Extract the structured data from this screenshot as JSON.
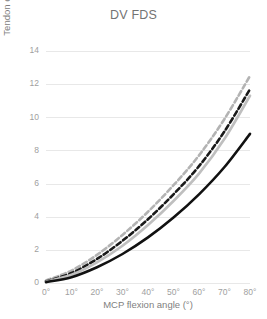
{
  "chart_data": {
    "type": "line",
    "title": "DV FDS",
    "xlabel": "MCP flexion angle (°)",
    "ylabel": "Tendon excursion (mm)",
    "x": [
      0,
      10,
      20,
      30,
      40,
      50,
      60,
      70,
      80
    ],
    "xticklabels": [
      "0°",
      "10°",
      "20°",
      "30°",
      "40°",
      "50°",
      "60°",
      "70°",
      "80°"
    ],
    "yticks": [
      0,
      2,
      4,
      6,
      8,
      10,
      12,
      14
    ],
    "yticklabels": [
      "0",
      "2",
      "4",
      "6",
      "8",
      "10",
      "12",
      "14"
    ],
    "xlim": [
      0,
      80
    ],
    "ylim": [
      0,
      14
    ],
    "grid": true,
    "grid_axis": "y",
    "legend": "none",
    "series": [
      {
        "name": "gray-dashed-upper",
        "color": "#b3b3b3",
        "style": "dashed",
        "width": 2.6,
        "dash": "5,3",
        "values": [
          0.15,
          0.75,
          1.7,
          2.9,
          4.3,
          5.9,
          7.7,
          9.9,
          12.5
        ]
      },
      {
        "name": "black-dashed",
        "color": "#1a1a1a",
        "style": "dashed",
        "width": 2.6,
        "dash": "5,3",
        "values": [
          0.1,
          0.6,
          1.45,
          2.55,
          3.85,
          5.35,
          7.05,
          9.15,
          11.7
        ]
      },
      {
        "name": "gray-solid",
        "color": "#bfbfbf",
        "style": "solid",
        "width": 2.6,
        "dash": "",
        "values": [
          0.08,
          0.5,
          1.25,
          2.25,
          3.5,
          4.95,
          6.6,
          8.7,
          11.3
        ]
      },
      {
        "name": "black-solid",
        "color": "#111111",
        "style": "solid",
        "width": 2.6,
        "dash": "",
        "values": [
          0.05,
          0.35,
          0.95,
          1.75,
          2.75,
          3.95,
          5.35,
          7.0,
          9.0
        ]
      }
    ]
  }
}
